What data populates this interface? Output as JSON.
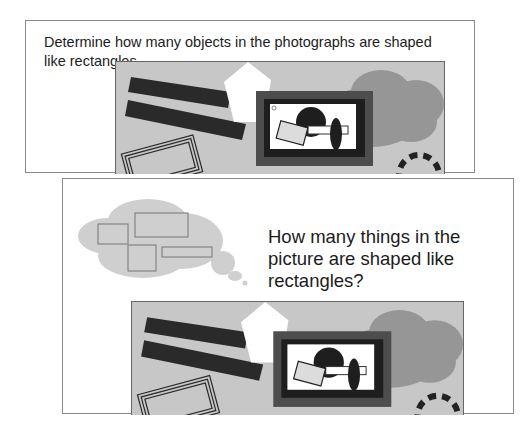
{
  "top_panel": {
    "prompt": "Determine how many objects in the photographs are shaped like rectangles."
  },
  "bottom_panel": {
    "prompt": "How many things in the picture are shaped like rectangles?"
  },
  "picture": {
    "description": "Gray scene with two dark tilted bars, white pentagon, framed picture containing a black circle, a tilted rectangle, a white bar and a black ellipse, a gray cloud, a triple-outline tilted rectangle, and a dashed circle",
    "colors": {
      "background": "#c7c7c7",
      "dark": "#2a2a2a",
      "frame_outer": "#4d4d4d",
      "cloud": "#969696",
      "white": "#ffffff"
    }
  },
  "thought_bubble": {
    "rectangle_count": 4,
    "color": "#cfcfcf"
  }
}
